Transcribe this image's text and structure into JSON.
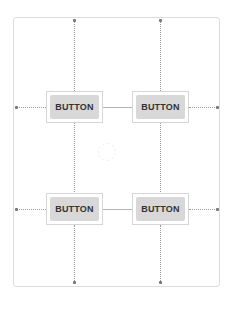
{
  "canvas": {
    "frame_color": "#dcdcdc",
    "button_color": "#d8d8d8"
  },
  "buttons": [
    {
      "label": "BUTTON",
      "row": 1,
      "col": 1
    },
    {
      "label": "BUTTON",
      "row": 1,
      "col": 2
    },
    {
      "label": "BUTTON",
      "row": 2,
      "col": 1
    },
    {
      "label": "BUTTON",
      "row": 2,
      "col": 2
    }
  ]
}
